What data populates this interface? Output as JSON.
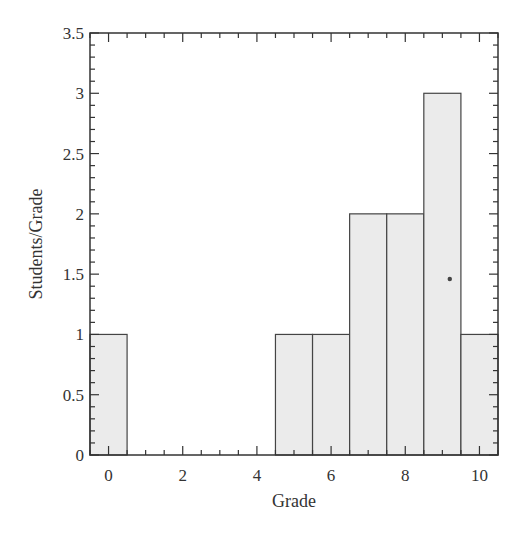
{
  "chart_data": {
    "type": "bar",
    "title": "",
    "xlabel": "Grade",
    "ylabel": "Students/Grade",
    "categories": [
      0,
      1,
      2,
      3,
      4,
      5,
      6,
      7,
      8,
      9,
      10
    ],
    "values": [
      1,
      0,
      0,
      0,
      0,
      1,
      1,
      2,
      2,
      3,
      1
    ],
    "xlim": [
      -0.5,
      10.5
    ],
    "ylim": [
      0,
      3.5
    ],
    "x_major_ticks": [
      0,
      2,
      4,
      6,
      8,
      10
    ],
    "x_minor_step": 0.5,
    "y_major_ticks": [
      0,
      0.5,
      1,
      1.5,
      2,
      2.5,
      3,
      3.5
    ],
    "y_minor_step": 0.1,
    "grid": false,
    "legend": null,
    "bar_fill": "#ebebeb",
    "bar_edge": "#444444",
    "annotations": [
      {
        "type": "dot",
        "x": 9.2,
        "y": 1.46
      }
    ]
  }
}
